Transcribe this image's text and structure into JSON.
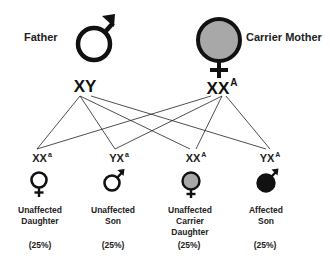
{
  "father": {
    "label": "Father",
    "genotype": "XY",
    "symbol": "male-symbol-icon"
  },
  "mother": {
    "label": "Carrier Mother",
    "genotype_base": "XX",
    "genotype_sup": "A",
    "symbol": "female-symbol-icon",
    "fill": "#a8a8a8"
  },
  "offspring": [
    {
      "genotype_base": "XX",
      "genotype_sup": "a",
      "label_line1": "Unaffected",
      "label_line2": "Daughter",
      "label_line3": "",
      "percent": "(25%)",
      "symbol": "female-symbol-icon",
      "fill": "#ffffff"
    },
    {
      "genotype_base": "YX",
      "genotype_sup": "a",
      "label_line1": "Unaffected",
      "label_line2": "Son",
      "label_line3": "",
      "percent": "(25%)",
      "symbol": "male-symbol-icon",
      "fill": "#ffffff"
    },
    {
      "genotype_base": "XX",
      "genotype_sup": "A",
      "label_line1": "Unaffected",
      "label_line2": "Carrier",
      "label_line3": "Daughter",
      "percent": "(25%)",
      "symbol": "female-symbol-icon",
      "fill": "#a8a8a8"
    },
    {
      "genotype_base": "YX",
      "genotype_sup": "A",
      "label_line1": "Affected",
      "label_line2": "Son",
      "label_line3": "",
      "percent": "(25%)",
      "symbol": "male-symbol-icon",
      "fill": "#111111"
    }
  ],
  "colors": {
    "stroke": "#111111",
    "carrier_fill": "#a8a8a8",
    "affected_fill": "#111111"
  }
}
